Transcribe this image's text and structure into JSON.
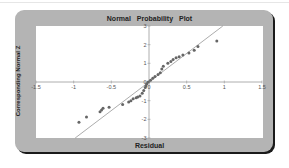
{
  "chart_data": {
    "type": "scatter",
    "title": "Normal Probability Plot",
    "xlabel": "Residual",
    "ylabel": "Corresponding Normal Z",
    "xlim": [
      -1.5,
      1.5
    ],
    "ylim": [
      -3,
      3
    ],
    "x_ticks": [
      "-1.5",
      "-1",
      "-0.5",
      "0",
      "0.5",
      "1",
      "1.5"
    ],
    "y_ticks": [
      "3",
      "2",
      "1",
      "0",
      "-1",
      "-2",
      "-3"
    ],
    "grid": false,
    "legend": null,
    "series": [
      {
        "name": "Residuals",
        "points": [
          [
            -0.93,
            -2.15
          ],
          [
            -0.83,
            -1.87
          ],
          [
            -0.65,
            -1.6
          ],
          [
            -0.63,
            -1.5
          ],
          [
            -0.61,
            -1.4
          ],
          [
            -0.53,
            -1.35
          ],
          [
            -0.35,
            -1.2
          ],
          [
            -0.27,
            -1.07
          ],
          [
            -0.24,
            -1.0
          ],
          [
            -0.21,
            -0.9
          ],
          [
            -0.17,
            -0.85
          ],
          [
            -0.15,
            -0.8
          ],
          [
            -0.12,
            -0.75
          ],
          [
            -0.09,
            -0.6
          ],
          [
            -0.07,
            -0.45
          ],
          [
            -0.05,
            -0.3
          ],
          [
            -0.04,
            -0.2
          ],
          [
            -0.03,
            -0.1
          ],
          [
            -0.01,
            0.0
          ],
          [
            0.02,
            0.1
          ],
          [
            0.05,
            0.2
          ],
          [
            0.08,
            0.3
          ],
          [
            0.12,
            0.4
          ],
          [
            0.15,
            0.5
          ],
          [
            0.17,
            0.7
          ],
          [
            0.19,
            0.85
          ],
          [
            0.25,
            1.0
          ],
          [
            0.29,
            1.1
          ],
          [
            0.32,
            1.2
          ],
          [
            0.36,
            1.3
          ],
          [
            0.4,
            1.35
          ],
          [
            0.45,
            1.45
          ],
          [
            0.53,
            1.55
          ],
          [
            0.6,
            1.7
          ],
          [
            0.65,
            1.9
          ],
          [
            0.9,
            2.2
          ]
        ]
      }
    ],
    "reference_line": {
      "from": [
        -0.98,
        -3
      ],
      "to": [
        0.98,
        3
      ]
    },
    "colors": {
      "panel": "#b4b4b4",
      "plot_bg": "#ffffff",
      "points": "#666666",
      "line": "#888888",
      "axes": "#999999"
    }
  }
}
